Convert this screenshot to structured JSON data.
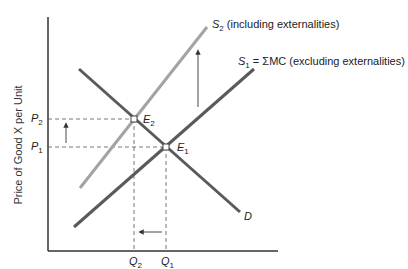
{
  "diagram": {
    "type": "supply-demand",
    "axis": {
      "y_label": "Price of Good X per Unit",
      "x_label": ""
    },
    "curves": {
      "demand": {
        "name": "D",
        "color": "#555555"
      },
      "s1": {
        "name": "S",
        "sub": "1",
        "suffix": " = ΣMC (excluding externalities)",
        "color": "#555555"
      },
      "s2": {
        "name": "S",
        "sub": "2",
        "suffix": " (including externalities)",
        "color": "#a0a0a0"
      }
    },
    "points": {
      "e1": {
        "name": "E",
        "sub": "1"
      },
      "e2": {
        "name": "E",
        "sub": "2"
      }
    },
    "price_ticks": {
      "p1": {
        "name": "P",
        "sub": "1"
      },
      "p2": {
        "name": "P",
        "sub": "2"
      }
    },
    "quantity_ticks": {
      "q1": {
        "name": "Q",
        "sub": "1"
      },
      "q2": {
        "name": "Q",
        "sub": "2"
      }
    },
    "arrows": {
      "supply_shift": "up",
      "price_change": "up",
      "quantity_change": "left"
    }
  }
}
